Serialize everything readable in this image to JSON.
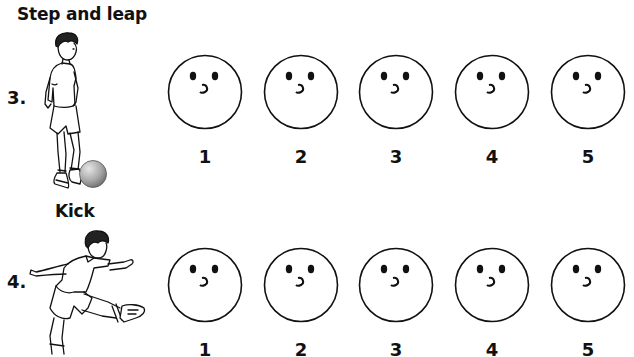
{
  "items": [
    {
      "number": "3.",
      "title": "Step and leap",
      "illustration": "boy-stepping-over-ball",
      "scale": {
        "face_icon": "neutral-face-icon",
        "options": [
          "1",
          "2",
          "3",
          "4",
          "5"
        ]
      }
    },
    {
      "number": "4.",
      "title": "Kick",
      "illustration": "boy-kicking",
      "scale": {
        "face_icon": "neutral-face-icon",
        "options": [
          "1",
          "2",
          "3",
          "4",
          "5"
        ]
      }
    }
  ],
  "colors": {
    "ink": "#111111",
    "ball_light": "#d8d8d8",
    "ball_dark": "#7a7a7a",
    "background": "#ffffff"
  }
}
